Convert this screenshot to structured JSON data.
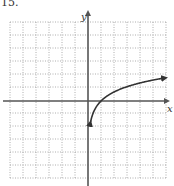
{
  "problem_label": "15.",
  "chart_data": {
    "type": "line",
    "title": "",
    "xlabel": "x",
    "ylabel": "y",
    "xlim": [
      -6,
      6
    ],
    "ylim": [
      -6,
      6
    ],
    "grid": true,
    "grid_style": "dotted",
    "function": "y = ln(x)",
    "series": [
      {
        "name": "curve",
        "x": [
          0.2,
          0.3,
          0.5,
          0.75,
          1,
          1.5,
          2,
          3,
          4,
          5,
          6
        ],
        "y": [
          -1.61,
          -1.2,
          -0.69,
          -0.29,
          0,
          0.41,
          0.69,
          1.1,
          1.39,
          1.61,
          1.79
        ],
        "arrows": [
          "start",
          "end"
        ]
      }
    ]
  },
  "colors": {
    "axis": "#555555",
    "grid": "#999999",
    "curve": "#333333"
  }
}
